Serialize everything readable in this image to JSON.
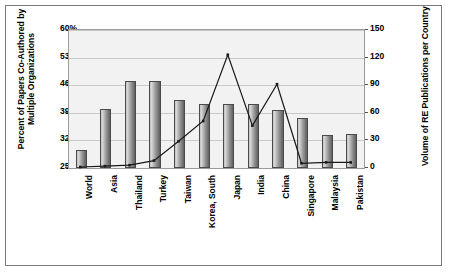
{
  "chart_data": {
    "type": "bar",
    "title": "",
    "categories": [
      "World",
      "Asia",
      "Thailand",
      "Turkey",
      "Taiwan",
      "Korea, South",
      "Japan",
      "India",
      "China",
      "Singapore",
      "Malaysia",
      "Pakistan"
    ],
    "series": [
      {
        "name": "Percent of Papers Co-Authored by Multiple Organizations",
        "type": "bar",
        "axis": "left",
        "values": [
          29.5,
          40.0,
          47.0,
          47.0,
          42.3,
          41.3,
          41.3,
          41.3,
          39.8,
          37.7,
          33.5,
          33.7
        ]
      },
      {
        "name": "Volume of RE Publications per Country",
        "type": "line",
        "axis": "right",
        "values": [
          0,
          1,
          2,
          7,
          28,
          50,
          122,
          45,
          90,
          4,
          5,
          5
        ]
      }
    ],
    "ylabel": "Percent of Papers Co-Authored by Multiple Organizations",
    "y2label": "Volume of RE Publications per Country",
    "xlabel": "",
    "ylim": [
      25,
      60
    ],
    "y2lim": [
      0,
      150
    ],
    "yticks": [
      "25%",
      "32%",
      "39%",
      "46%",
      "53%",
      "60%"
    ],
    "y2ticks": [
      "0",
      "30",
      "60",
      "90",
      "120",
      "150"
    ],
    "grid": true,
    "legend": "none"
  },
  "axes": {
    "left_title": "Percent of Papers Co-Authored by Multiple Organizations",
    "right_title": "Volume of RE Publications per Country"
  },
  "colors": {
    "bar_fill_light": "#dcdcdc",
    "bar_fill_dark": "#5f5f5f",
    "line": "#1a1a1a",
    "plot_background": "#f2f2f2",
    "gridline": "#c9c9c9",
    "frame_border": "#7a7a7a"
  }
}
